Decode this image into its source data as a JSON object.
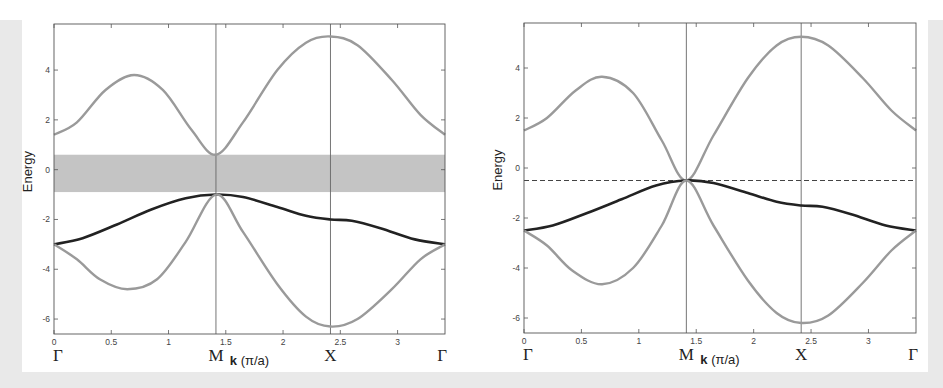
{
  "colors": {
    "band_gray": "#9a9a9a",
    "band_black": "#222222",
    "gap_fill": "#c4c4c4",
    "frame": "#555555",
    "dashed": "#444444",
    "background": "#e9e9e9"
  },
  "chart_data": [
    {
      "type": "line",
      "title": "",
      "xlabel": "k (π/a)",
      "xlabel_bold_part": "k",
      "xlabel_rest": " (π/a)",
      "ylabel": "Energy",
      "xlim": [
        0,
        3.414
      ],
      "ylim": [
        -6.6,
        5.85
      ],
      "grid": false,
      "x_ticks": [
        0,
        0.5,
        1,
        1.5,
        2,
        2.5,
        3
      ],
      "x_tick_labels": [
        "0",
        "0.5",
        "1",
        "1.5",
        "2",
        "2.5",
        "3"
      ],
      "y_ticks": [
        4,
        2,
        0,
        -2,
        -4,
        -6
      ],
      "y_tick_labels": [
        "4",
        "2",
        "0",
        "-2",
        "-4",
        "-6"
      ],
      "high_symmetry_points": [
        {
          "label": "Γ",
          "k": 0
        },
        {
          "label": "M",
          "k": 1.414
        },
        {
          "label": "X",
          "k": 2.414
        },
        {
          "label": "Γ",
          "k": 3.414
        }
      ],
      "vertical_lines": [
        1.414,
        2.414
      ],
      "shaded_band": {
        "ymin": -0.9,
        "ymax": 0.6,
        "label": "band gap region"
      },
      "series": [
        {
          "name": "upper band",
          "color": "gray",
          "x": [
            0,
            0.2,
            0.45,
            0.7,
            0.95,
            1.2,
            1.414,
            1.65,
            1.95,
            2.2,
            2.414,
            2.65,
            2.95,
            3.2,
            3.414
          ],
          "y": [
            1.4,
            1.9,
            3.2,
            3.8,
            3.2,
            1.6,
            0.6,
            1.9,
            4.0,
            5.1,
            5.35,
            5.0,
            3.6,
            2.2,
            1.4
          ]
        },
        {
          "name": "middle band",
          "color": "black",
          "x": [
            0,
            0.25,
            0.55,
            0.85,
            1.15,
            1.414,
            1.65,
            1.95,
            2.2,
            2.414,
            2.6,
            2.85,
            3.15,
            3.414
          ],
          "y": [
            -3.0,
            -2.75,
            -2.2,
            -1.6,
            -1.15,
            -1.0,
            -1.1,
            -1.5,
            -1.85,
            -2.0,
            -2.05,
            -2.35,
            -2.8,
            -3.0
          ]
        },
        {
          "name": "lower band",
          "color": "gray",
          "x": [
            0,
            0.2,
            0.4,
            0.64,
            0.9,
            1.15,
            1.414,
            1.65,
            1.95,
            2.2,
            2.414,
            2.65,
            2.95,
            3.2,
            3.414
          ],
          "y": [
            -3.0,
            -3.6,
            -4.4,
            -4.8,
            -4.4,
            -2.9,
            -1.0,
            -2.5,
            -4.6,
            -5.9,
            -6.3,
            -6.0,
            -4.8,
            -3.6,
            -3.0
          ]
        }
      ]
    },
    {
      "type": "line",
      "title": "",
      "xlabel": "k (π/a)",
      "xlabel_bold_part": "k",
      "xlabel_rest": " (π/a)",
      "ylabel": "Energy",
      "xlim": [
        0,
        3.414
      ],
      "ylim": [
        -6.6,
        5.8
      ],
      "grid": false,
      "x_ticks": [
        0,
        0.5,
        1,
        1.5,
        2,
        2.5,
        3
      ],
      "x_tick_labels": [
        "0",
        "0.5",
        "1",
        "1.5",
        "2",
        "2.5",
        "3"
      ],
      "y_ticks": [
        4,
        2,
        0,
        -2,
        -4,
        -6
      ],
      "y_tick_labels": [
        "4",
        "2",
        "0",
        "-2",
        "-4",
        "-6"
      ],
      "high_symmetry_points": [
        {
          "label": "Γ",
          "k": 0
        },
        {
          "label": "M",
          "k": 1.414
        },
        {
          "label": "X",
          "k": 2.414
        },
        {
          "label": "Γ",
          "k": 3.414
        }
      ],
      "vertical_lines": [
        1.414,
        2.414
      ],
      "dashed_hline": -0.5,
      "series": [
        {
          "name": "upper band",
          "color": "gray",
          "x": [
            0,
            0.2,
            0.45,
            0.68,
            0.95,
            1.2,
            1.414,
            1.65,
            1.95,
            2.2,
            2.414,
            2.65,
            2.95,
            3.2,
            3.414
          ],
          "y": [
            1.5,
            2.0,
            3.1,
            3.65,
            3.0,
            1.1,
            -0.5,
            1.3,
            3.6,
            4.9,
            5.25,
            4.9,
            3.6,
            2.3,
            1.5
          ]
        },
        {
          "name": "middle band",
          "color": "black",
          "x": [
            0,
            0.25,
            0.55,
            0.85,
            1.15,
            1.414,
            1.65,
            1.95,
            2.2,
            2.414,
            2.6,
            2.85,
            3.15,
            3.414
          ],
          "y": [
            -2.5,
            -2.3,
            -1.8,
            -1.25,
            -0.7,
            -0.5,
            -0.6,
            -1.0,
            -1.35,
            -1.5,
            -1.55,
            -1.85,
            -2.3,
            -2.5
          ]
        },
        {
          "name": "lower band",
          "color": "gray",
          "x": [
            0,
            0.2,
            0.42,
            0.68,
            0.95,
            1.2,
            1.414,
            1.65,
            1.95,
            2.2,
            2.414,
            2.65,
            2.95,
            3.2,
            3.414
          ],
          "y": [
            -2.5,
            -3.1,
            -4.1,
            -4.65,
            -4.0,
            -2.3,
            -0.5,
            -2.3,
            -4.5,
            -5.8,
            -6.2,
            -5.9,
            -4.6,
            -3.3,
            -2.5
          ]
        }
      ]
    }
  ]
}
